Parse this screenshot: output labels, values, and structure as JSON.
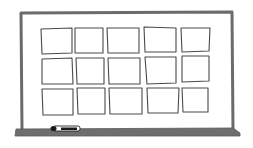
{
  "illustration": {
    "subject": "whiteboard with sticky note grid",
    "colors": {
      "frame": "#6b6b6b",
      "tray": "#6e6e6e",
      "card_stroke": "#4a4a4a",
      "card_fill": "#ffffff",
      "board_fill": "#ffffff",
      "marker_body": "#ffffff",
      "marker_cap": "#1a1a1a"
    },
    "board": {
      "x": 21,
      "y": 12,
      "width": 212,
      "height": 118
    },
    "tray": {
      "x": 15,
      "y": 128,
      "width": 226,
      "height": 8
    },
    "grid": {
      "rows": 3,
      "columns": 5
    },
    "cards": [
      {
        "row": 0,
        "col": 0,
        "pts": "41,29 72,28 72,53 42,54"
      },
      {
        "row": 0,
        "col": 1,
        "pts": "75,28 103,28 103,53 75,53"
      },
      {
        "row": 0,
        "col": 2,
        "pts": "107,28 139,28 139,53 108,53"
      },
      {
        "row": 0,
        "col": 3,
        "pts": "144,27 176,28 176,52 145,52"
      },
      {
        "row": 0,
        "col": 4,
        "pts": "181,28 210,28 209,51 182,52"
      },
      {
        "row": 1,
        "col": 0,
        "pts": "42,59 72,58 73,84 42,84"
      },
      {
        "row": 1,
        "col": 1,
        "pts": "76,58 104,58 104,84 77,84"
      },
      {
        "row": 1,
        "col": 2,
        "pts": "108,58 140,58 140,84 109,84"
      },
      {
        "row": 1,
        "col": 3,
        "pts": "145,57 176,57 176,83 147,84"
      },
      {
        "row": 1,
        "col": 4,
        "pts": "182,56 209,56 209,81 182,82"
      },
      {
        "row": 2,
        "col": 0,
        "pts": "42,89 73,89 73,115 43,115"
      },
      {
        "row": 2,
        "col": 1,
        "pts": "77,88 105,88 105,114 78,114"
      },
      {
        "row": 2,
        "col": 2,
        "pts": "109,88 142,88 142,114 110,114"
      },
      {
        "row": 2,
        "col": 3,
        "pts": "147,88 179,88 178,113 148,113"
      },
      {
        "row": 2,
        "col": 4,
        "pts": "182,88 208,88 208,112 183,112"
      }
    ],
    "marker": {
      "x": 52,
      "y": 125,
      "width": 28,
      "height": 6
    }
  }
}
